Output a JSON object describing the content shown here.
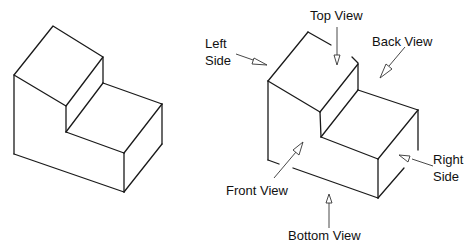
{
  "diagram": {
    "title": "",
    "left_figure": {
      "description": "Isometric view of stepped block (L-shape)"
    },
    "right_figure": {
      "description": "Isometric stepped block annotated with six principal view directions",
      "labels": {
        "top_view": "Top View",
        "left_side_line1": "Left",
        "left_side_line2": "Side",
        "back_view": "Back View",
        "front_view": "Front View",
        "right_side_line1": "Right",
        "right_side_line2": "Side",
        "bottom_view": "Bottom View"
      }
    },
    "colors": {
      "line": "#1a1a1a",
      "background": "#ffffff"
    }
  }
}
